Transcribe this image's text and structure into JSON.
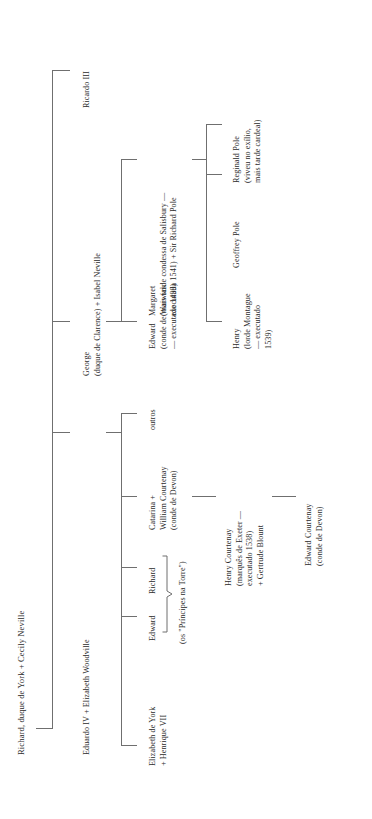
{
  "chart_type": "genealogical-family-tree",
  "orientation": "rotated-90-counterclockwise",
  "accent_color": "#6f6f6f",
  "text_color": "#2b2b2b",
  "background_color": "#ffffff",
  "root": {
    "label_lines": [
      "Richard, duque de York + Cecily Neville"
    ],
    "label": "Richard, duque de York + Cecily Neville"
  },
  "generation2": {
    "ricardo_iii": {
      "label_lines": [
        "Ricardo III"
      ],
      "label": "Ricardo III"
    },
    "george": {
      "label_lines": [
        "George",
        "(duque de Clarence) + Isabel Neville"
      ],
      "line1": "George",
      "line2": "(duque de Clarence) + Isabel Neville"
    },
    "eduardo_iv": {
      "label_lines": [
        "Eduardo IV + Elizabeth Woodville"
      ],
      "label": "Eduardo IV + Elizabeth Woodville"
    }
  },
  "generation3_clarence": {
    "edward_warwick": {
      "line1": "Edward",
      "line2": "(conde de Warwick",
      "line3": "— executado 1499)"
    },
    "margaret": {
      "line1": "Margaret",
      "line2": "(mais tarde condessa de Salisbury —",
      "line3": "executada 1541) + Sir Richard Pole"
    }
  },
  "generation4_pole": {
    "henry_montague": {
      "line1": "Henry",
      "line2": "(lorde Montague",
      "line3": "— executado",
      "line4": "1539)"
    },
    "geoffrey_pole": {
      "line1": "Geoffrey Pole"
    },
    "reginald_pole": {
      "line1": "Reginald Pole",
      "line2": "(viveu no exílio,",
      "line3": "mais tarde cardeal)"
    }
  },
  "generation3_edward_iv": {
    "outros": {
      "label": "outros"
    },
    "catarina": {
      "line1": "Catarina +",
      "line2": "William Courtenay",
      "line3": "(conde de Devon)"
    },
    "richard": {
      "label": "Richard"
    },
    "edward": {
      "label": "Edward"
    },
    "princes_note": {
      "label": "(os \"Príncipes na Torre\")"
    },
    "elizabeth_de_york": {
      "line1": "Elizabeth de York",
      "line2": "+ Henrique VII"
    }
  },
  "generation4_courtenay": {
    "henry_courtenay": {
      "line1": "Henry Courtenay",
      "line2": "(marquês de Exeter —",
      "line3": "executado 1538)",
      "line4": "+ Gertrude Blount"
    }
  },
  "generation5_courtenay": {
    "edward_courtenay": {
      "line1": "Edward Courtenay",
      "line2": "(conde de Devon)"
    }
  }
}
